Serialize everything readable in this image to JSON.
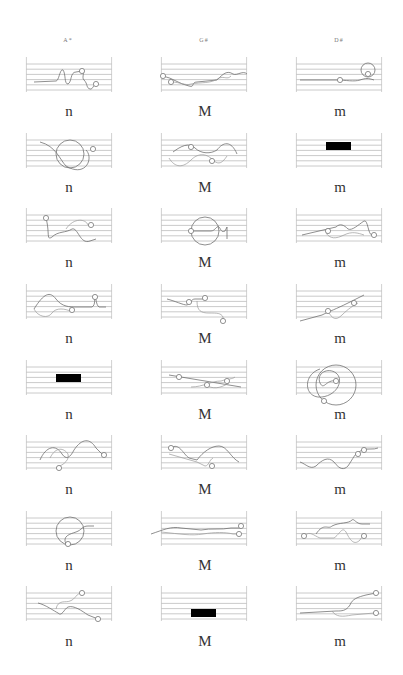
{
  "columns": [
    {
      "header": "A*",
      "cx": 68,
      "x0": 26,
      "label": "n"
    },
    {
      "header": "G#",
      "cx": 204,
      "x0": 161,
      "label": "M"
    },
    {
      "header": "D#",
      "cx": 339,
      "x0": 296,
      "label": "m"
    }
  ],
  "rows": [
    {
      "staff_top": 62,
      "label_y": 104
    },
    {
      "staff_top": 138,
      "label_y": 180
    },
    {
      "staff_top": 213,
      "label_y": 255
    },
    {
      "staff_top": 289,
      "label_y": 331
    },
    {
      "staff_top": 365,
      "label_y": 407
    },
    {
      "staff_top": 440,
      "label_y": 482
    },
    {
      "staff_top": 516,
      "label_y": 558
    },
    {
      "staff_top": 591,
      "label_y": 634
    }
  ],
  "staff": {
    "width": 86,
    "height": 30,
    "line_count": 6
  },
  "labels": {
    "col1": "n",
    "col2": "M",
    "col3": "m"
  },
  "headers": {
    "col1": "A*",
    "col2": "G#",
    "col3": "D#"
  },
  "cells": [
    [
      {
        "type": "scribble",
        "paths": [
          "M8 20 L30 19 C33 19 34 6 37 8 C40 12 38 22 42 22 C46 20 44 10 50 10 L56 9 C60 9 55 15 58 18 C62 22 60 26 64 27 C67 28 67 22 71 22"
        ],
        "dots": [
          [
            56,
            9
          ],
          [
            70,
            22
          ]
        ]
      },
      {
        "type": "scribble",
        "paths": [
          "M14 4 C30 8 34 22 40 28 C60 40 68 20 60 12"
        ],
        "circles": [
          [
            44,
            16,
            14
          ]
        ],
        "dots": [
          [
            67,
            11
          ]
        ]
      },
      {
        "type": "scribble",
        "paths": [
          "M20 5 C24 20 20 28 26 24 C32 18 40 20 46 16 C52 14 54 32 64 28 L70 26",
          "M40 16 C48 4 60 6 62 12"
        ],
        "dots": [
          [
            20,
            5
          ],
          [
            65,
            12
          ]
        ]
      },
      {
        "type": "scribble",
        "paths": [
          "M8 20 C18 4 24 2 30 10 C36 18 44 18 50 18 L66 18 C70 16 68 8 69 8 C70 8 70 16 73 18 L80 18",
          "M8 20 C12 28 22 30 26 24 C30 18 40 20 44 22"
        ],
        "dots": [
          [
            46,
            21
          ],
          [
            69,
            8
          ]
        ]
      },
      {
        "type": "block",
        "rect": [
          30,
          9,
          25,
          8
        ]
      },
      {
        "type": "scribble",
        "paths": [
          "M14 20 C20 6 30 4 36 14 C40 20 44 18 48 10 C56 -2 64 -2 70 8 L78 16",
          "M24 18 C30 6 38 8 42 14 C44 22 34 26 30 28"
        ],
        "dots": [
          [
            33,
            28
          ],
          [
            78,
            15
          ]
        ]
      },
      {
        "type": "scribble",
        "paths": [
          "M40 28 C36 20 44 18 50 16 C56 14 56 10 62 10 L68 10"
        ],
        "circles": [
          [
            44,
            15,
            14
          ]
        ],
        "dots": [
          [
            42,
            28
          ]
        ]
      },
      {
        "type": "scribble",
        "paths": [
          "M12 12 C20 14 28 20 32 22 C36 26 38 18 42 16 C48 14 56 20 62 24 L72 28",
          "M30 18 C32 8 40 12 44 10 C50 8 50 2 56 2"
        ],
        "dots": [
          [
            56,
            2
          ],
          [
            72,
            28
          ]
        ]
      }
    ],
    [
      {
        "type": "scribble",
        "paths": [
          "M2 14 C12 16 18 22 28 24 C34 26 30 20 36 20 L56 18 C62 12 66 8 72 12 C76 14 82 8 86 12",
          "M10 20 C20 20 24 24 30 22 C40 20 50 22 58 16 C64 14 66 18 70 14"
        ],
        "dots": [
          [
            2,
            14
          ],
          [
            10,
            20
          ]
        ]
      },
      {
        "type": "scribble",
        "paths": [
          "M12 14 C20 8 28 4 34 10 C40 16 50 16 56 12 C62 4 70 2 76 16",
          "M8 20 C14 30 22 30 30 22 C36 16 44 14 52 22 C58 28 62 24 66 18"
        ],
        "dots": [
          [
            30,
            9
          ],
          [
            51,
            23
          ]
        ]
      },
      {
        "type": "scribble",
        "paths": [
          "M30 18 L50 18 C54 18 56 12 58 14 C60 16 60 20 64 18 L66 14 L66 26"
        ],
        "circles": [
          [
            44,
            18,
            14
          ]
        ],
        "dots": [
          [
            30,
            18
          ]
        ]
      },
      {
        "type": "scribble",
        "paths": [
          "M6 10 C14 12 22 16 26 16 C30 14 30 10 34 10 L44 10",
          "M36 12 C36 22 40 24 48 24 C56 24 60 24 62 28 L62 32"
        ],
        "dots": [
          [
            28,
            13
          ],
          [
            44,
            9
          ],
          [
            62,
            32
          ]
        ]
      },
      {
        "type": "scribble",
        "paths": [
          "M8 10 L80 22",
          "M30 22 C42 22 50 16 60 16 C66 14 72 14 74 12",
          "M44 20 C52 24 58 24 68 18"
        ],
        "dots": [
          [
            18,
            12
          ],
          [
            46,
            20
          ],
          [
            66,
            16
          ]
        ]
      },
      {
        "type": "scribble",
        "paths": [
          "M10 8 C18 2 22 14 28 18 L36 20 C42 12 50 6 58 6 C66 6 70 18 78 22",
          "M8 14 L36 22 L44 26 C48 26 48 20 52 18"
        ],
        "dots": [
          [
            10,
            8
          ],
          [
            51,
            26
          ]
        ]
      },
      {
        "type": "scribble",
        "paths": [
          "M-10 18 C2 14 10 10 20 12 L40 14 C50 12 60 14 70 12 L80 12",
          "M0 16 C20 18 30 20 42 18 C54 16 64 16 72 18 L78 18"
        ],
        "dots": [
          [
            80,
            10
          ],
          [
            78,
            18
          ]
        ]
      },
      {
        "type": "block",
        "rect": [
          30,
          18,
          25,
          8
        ]
      }
    ],
    [
      {
        "type": "scribble",
        "paths": [
          "M4 18 L40 18 C50 18 58 20 64 18 C70 16 72 16 78 18"
        ],
        "circles": [
          [
            72,
            8,
            7
          ]
        ],
        "dots": [
          [
            44,
            18
          ],
          [
            72,
            12
          ]
        ]
      },
      {
        "type": "block",
        "rect": [
          30,
          4,
          25,
          8
        ]
      },
      {
        "type": "scribble",
        "paths": [
          "M6 22 L40 14 C44 10 48 12 52 16 C56 18 62 12 68 8 C72 6 72 22 76 22",
          "M30 20 C34 26 40 26 48 22 C56 18 62 20 68 22"
        ],
        "dots": [
          [
            32,
            18
          ],
          [
            78,
            22
          ]
        ]
      },
      {
        "type": "scribble",
        "paths": [
          "M4 32 L26 26 C34 22 40 20 52 14 L68 6",
          "M32 22 C36 30 40 32 46 26 C52 20 58 16 62 14"
        ],
        "dots": [
          [
            32,
            22
          ],
          [
            58,
            14
          ]
        ]
      },
      {
        "type": "scribble",
        "paths": [
          "M24 4 C6 10 8 34 26 32 C42 30 48 14 40 8 C32 2 20 8 24 18 C28 26 30 14 40 16"
        ],
        "circles": [
          [
            40,
            20,
            20
          ]
        ],
        "dots": [
          [
            40,
            16
          ],
          [
            28,
            36
          ]
        ]
      },
      {
        "type": "scribble",
        "paths": [
          "M4 22 C10 24 14 30 20 26 C26 20 32 16 38 22 C44 30 48 30 52 26 C56 20 58 16 60 14 L66 10 C70 8 78 10 82 8"
        ],
        "dots": [
          [
            62,
            14
          ],
          [
            68,
            10
          ]
        ]
      },
      {
        "type": "scribble",
        "paths": [
          "M20 18 C28 6 32 14 36 10 C44 6 52 8 56 4 C58 2 60 8 66 8 L74 8",
          "M8 20 C14 14 18 20 24 22 L38 22 C44 18 46 10 50 16 C54 24 58 30 64 24 C66 20 68 20 70 20"
        ],
        "dots": [
          [
            8,
            20
          ],
          [
            68,
            20
          ]
        ]
      },
      {
        "type": "scribble",
        "paths": [
          "M4 22 L40 20 C46 20 50 20 54 14 C56 8 62 6 70 4 L80 2",
          "M36 20 C40 26 46 26 56 24 L78 22"
        ],
        "dots": [
          [
            80,
            2
          ],
          [
            80,
            22
          ]
        ]
      }
    ]
  ]
}
